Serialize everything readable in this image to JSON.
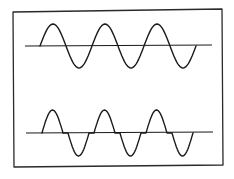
{
  "diagram": {
    "title": "",
    "colors": {
      "background": "#ffffff",
      "line": "#1a1a1a",
      "frame": "#2a2a2a"
    },
    "frame": {
      "x1": 13,
      "y1": 11,
      "x2": 223,
      "y2": 167
    },
    "waveforms": [
      {
        "name": "sine-wave",
        "label": "",
        "axis": {
          "x_start": 25,
          "x_end": 212,
          "y": 46
        },
        "start_x": 40,
        "cycles": 3,
        "period": 52,
        "amplitude": 22,
        "crossover_gap": 0
      },
      {
        "name": "crossover-distorted-wave",
        "label": "",
        "axis": {
          "x_start": 26,
          "x_end": 213,
          "y": 133
        },
        "start_x": 42,
        "cycles": 3,
        "period": 52,
        "amplitude": 23,
        "crossover_gap": 5
      }
    ]
  }
}
